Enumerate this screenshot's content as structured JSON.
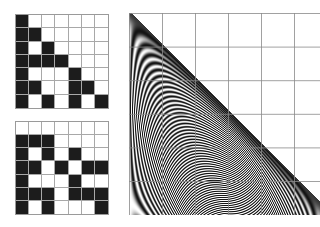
{
  "figure": {
    "grid_top": {
      "rows": 7,
      "cols": 7,
      "cells": [
        [
          1,
          0,
          0,
          0,
          0,
          0,
          0
        ],
        [
          1,
          1,
          0,
          0,
          0,
          0,
          0
        ],
        [
          1,
          0,
          1,
          0,
          0,
          0,
          0
        ],
        [
          1,
          1,
          1,
          1,
          0,
          0,
          0
        ],
        [
          1,
          0,
          0,
          0,
          1,
          0,
          0
        ],
        [
          1,
          1,
          0,
          0,
          1,
          1,
          0
        ],
        [
          1,
          0,
          1,
          0,
          1,
          0,
          1
        ]
      ]
    },
    "grid_bottom": {
      "rows": 7,
      "cols": 7,
      "cells": [
        [
          0,
          0,
          0,
          0,
          0,
          0,
          0
        ],
        [
          1,
          1,
          1,
          0,
          0,
          0,
          0
        ],
        [
          1,
          0,
          1,
          0,
          1,
          0,
          0
        ],
        [
          1,
          1,
          0,
          1,
          0,
          1,
          1
        ],
        [
          1,
          0,
          0,
          0,
          1,
          0,
          0
        ],
        [
          1,
          1,
          1,
          0,
          1,
          1,
          1
        ],
        [
          1,
          0,
          1,
          0,
          0,
          0,
          1
        ]
      ]
    },
    "fringe_panel": {
      "grid_cols_px": 33,
      "grid_rows_px": 33.6,
      "hypotenuse_dark": true,
      "fringe_scale": 95,
      "colors": {
        "dark": "#111111",
        "light": "#ffffff",
        "gridline": "#8a8a8a"
      }
    }
  }
}
